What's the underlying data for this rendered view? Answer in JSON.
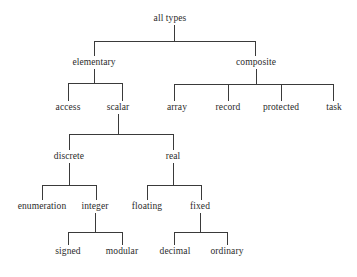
{
  "diagram": {
    "title": "all types",
    "kind": "hierarchy-tree",
    "style": {
      "line_color": "#3a3a3a",
      "text_color": "#2b2b2b",
      "background": "#ffffff"
    },
    "nodes": [
      {
        "id": "all-types",
        "label": "all types",
        "x": 170,
        "y": 19,
        "level": 0
      },
      {
        "id": "elementary",
        "label": "elementary",
        "x": 94,
        "y": 63,
        "level": 1
      },
      {
        "id": "composite",
        "label": "composite",
        "x": 256,
        "y": 63,
        "level": 1
      },
      {
        "id": "access",
        "label": "access",
        "x": 68,
        "y": 108,
        "level": 2
      },
      {
        "id": "scalar",
        "label": "scalar",
        "x": 118,
        "y": 108,
        "level": 2
      },
      {
        "id": "array",
        "label": "array",
        "x": 177,
        "y": 108,
        "level": 2
      },
      {
        "id": "record",
        "label": "record",
        "x": 228,
        "y": 108,
        "level": 2
      },
      {
        "id": "protected",
        "label": "protected",
        "x": 281,
        "y": 108,
        "level": 2
      },
      {
        "id": "task",
        "label": "task",
        "x": 334,
        "y": 108,
        "level": 2
      },
      {
        "id": "discrete",
        "label": "discrete",
        "x": 69,
        "y": 157,
        "level": 3
      },
      {
        "id": "real",
        "label": "real",
        "x": 173,
        "y": 157,
        "level": 3
      },
      {
        "id": "enumeration",
        "label": "enumeration",
        "x": 42,
        "y": 207,
        "level": 4
      },
      {
        "id": "integer",
        "label": "integer",
        "x": 95,
        "y": 207,
        "level": 4
      },
      {
        "id": "floating",
        "label": "floating",
        "x": 147,
        "y": 207,
        "level": 4
      },
      {
        "id": "fixed",
        "label": "fixed",
        "x": 200,
        "y": 207,
        "level": 4
      },
      {
        "id": "signed",
        "label": "signed",
        "x": 68,
        "y": 252,
        "level": 5
      },
      {
        "id": "modular",
        "label": "modular",
        "x": 122,
        "y": 252,
        "level": 5
      },
      {
        "id": "decimal",
        "label": "decimal",
        "x": 175,
        "y": 252,
        "level": 5
      },
      {
        "id": "ordinary",
        "label": "ordinary",
        "x": 227,
        "y": 252,
        "level": 5
      }
    ],
    "branches": [
      {
        "parent": "all-types",
        "stem_x": 174,
        "stem_top": 25,
        "bar_y": 41,
        "children_top": 56,
        "child_xs": [
          94,
          255
        ]
      },
      {
        "parent": "elementary",
        "stem_x": 94,
        "stem_top": 69,
        "bar_y": 83,
        "children_top": 101,
        "child_xs": [
          68,
          122
        ]
      },
      {
        "parent": "composite",
        "stem_x": 256,
        "stem_top": 69,
        "bar_y": 84,
        "children_top": 101,
        "child_xs": [
          174,
          228,
          281,
          333
        ]
      },
      {
        "parent": "scalar",
        "stem_x": 118,
        "stem_top": 114,
        "bar_y": 134,
        "children_top": 150,
        "child_xs": [
          69,
          173
        ]
      },
      {
        "parent": "discrete",
        "stem_x": 69,
        "stem_top": 163,
        "bar_y": 185,
        "children_top": 200,
        "child_xs": [
          42,
          96
        ]
      },
      {
        "parent": "real",
        "stem_x": 173,
        "stem_top": 163,
        "bar_y": 185,
        "children_top": 200,
        "child_xs": [
          147,
          201
        ]
      },
      {
        "parent": "integer",
        "stem_x": 95,
        "stem_top": 213,
        "bar_y": 232,
        "children_top": 245,
        "child_xs": [
          68,
          122
        ]
      },
      {
        "parent": "fixed",
        "stem_x": 200,
        "stem_top": 213,
        "bar_y": 232,
        "children_top": 245,
        "child_xs": [
          174,
          227
        ]
      }
    ]
  }
}
